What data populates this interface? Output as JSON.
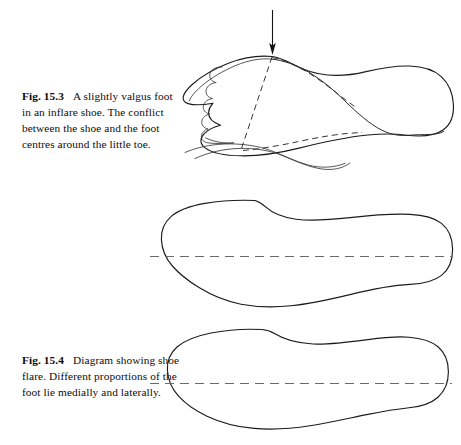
{
  "document": {
    "background_color": "#ffffff",
    "ink_color": "#1b1b1b",
    "centerline_color": "#6a6a6a"
  },
  "figures": [
    {
      "id": "fig-15-3",
      "number": "Fig. 15.3",
      "caption": "A slightly valgus foot in an inflare shoe. The conflict between the shoe and the foot centres around the little toe.",
      "caption_lines": [
        "A slightly",
        "valgus foot in an inflare",
        "shoe. The conflict",
        "between the shoe and",
        "the foot centres around",
        "the little toe."
      ],
      "annotations": [
        {
          "type": "arrow",
          "direction": "down",
          "target": "little-toe-conflict-point"
        }
      ],
      "elements": [
        "shoe-outline",
        "foot-outline",
        "toe-scallops",
        "shoe-centre-dashed-axis"
      ]
    },
    {
      "id": "fig-15-4",
      "number": "Fig. 15.4",
      "caption": "Diagram showing shoe flare. Different proportions of the foot lie medially and laterally.",
      "caption_lines": [
        "Diagram",
        "showing shoe flare.",
        "Different proportions of",
        "the foot lie medially and",
        "laterally."
      ],
      "annotations": [],
      "elements": [
        "straight-last-outline",
        "flared-last-outline",
        "centre-dashed-axis"
      ]
    }
  ],
  "diagrams": {
    "top": {
      "name": "valgus-foot-in-inflare-shoe",
      "label": "shoe and foot outlines superimposed, arrow marking the little-toe conflict"
    },
    "middle": {
      "name": "shoe-last-outline-upper",
      "label": "shoe outline with longitudinal centre line"
    },
    "bottom": {
      "name": "shoe-last-outline-lower",
      "label": "flared shoe outline with longitudinal centre line"
    }
  }
}
